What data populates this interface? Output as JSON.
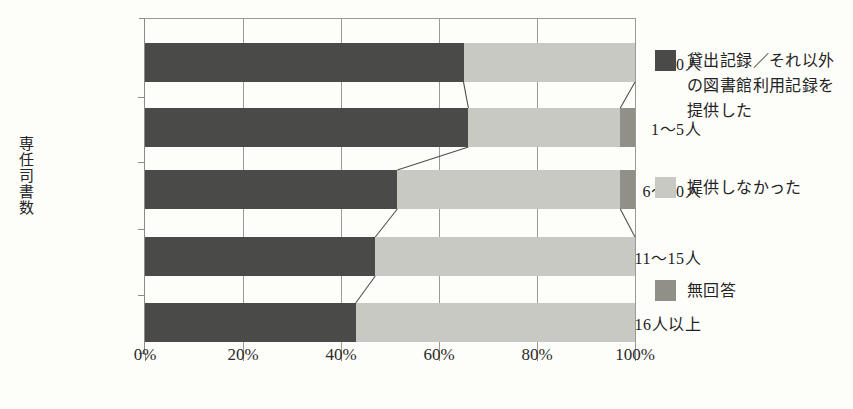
{
  "chart_data": {
    "type": "bar",
    "orientation": "horizontal",
    "stacked": true,
    "normalized_percent": true,
    "title": "",
    "xlabel": "",
    "ylabel": "専任司書数",
    "xlim": [
      0,
      100
    ],
    "xticks": [
      0,
      20,
      40,
      60,
      80,
      100
    ],
    "xticklabels": [
      "0%",
      "20%",
      "40%",
      "60%",
      "80%",
      "100%"
    ],
    "grid": true,
    "legend_position": "right",
    "categories": [
      "0人",
      "1〜5人",
      "6〜10人",
      "11〜15人",
      "16人以上"
    ],
    "series": [
      {
        "name": "貸出記録／それ以外の図書館利用記録を提供した",
        "color": "#4a4a48",
        "values": [
          65,
          66,
          51.5,
          47,
          43
        ]
      },
      {
        "name": "提供しなかった",
        "color": "#c9c9c3",
        "values": [
          35,
          31,
          45.5,
          53,
          57
        ]
      },
      {
        "name": "無回答",
        "color": "#909089",
        "values": [
          0,
          3,
          3,
          0,
          0
        ]
      }
    ]
  },
  "axis": {
    "y_title": "専任司書数",
    "x_tick_labels": [
      "0%",
      "20%",
      "40%",
      "60%",
      "80%",
      "100%"
    ]
  },
  "legend": {
    "items": [
      {
        "label": "貸出記録／それ以外の図書館利用記録を提供した",
        "color": "#4a4a48"
      },
      {
        "label": "提供しなかった",
        "color": "#c9c9c3"
      },
      {
        "label": "無回答",
        "color": "#909089"
      }
    ]
  },
  "colors": {
    "series_dark": "#4a4a48",
    "series_light": "#c9c9c3",
    "series_mid": "#909089",
    "axis": "#8d8d86",
    "grid": "#9a9a93",
    "background": "#fdfdfa",
    "text": "#232323"
  }
}
